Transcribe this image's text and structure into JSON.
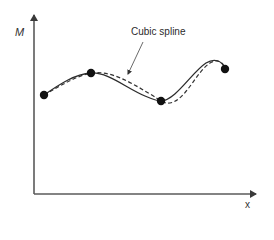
{
  "diagram": {
    "title": "",
    "y_axis_label": "M",
    "x_axis_label": "x",
    "annotation": "Cubic spline",
    "colors": {
      "axis": "#5a5a5a",
      "curve": "#333333",
      "points": "#111111",
      "text": "#333333"
    },
    "points": [
      {
        "x": 44,
        "y": 95
      },
      {
        "x": 91,
        "y": 73
      },
      {
        "x": 161,
        "y": 101
      },
      {
        "x": 225,
        "y": 69
      }
    ],
    "series": [
      {
        "name": "Cubic spline",
        "style": "dashed"
      },
      {
        "name": "Interpolated curve",
        "style": "solid"
      }
    ]
  }
}
